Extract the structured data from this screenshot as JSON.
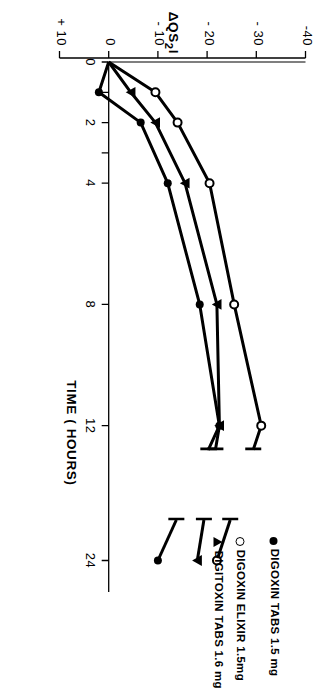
{
  "chart_data": {
    "type": "line",
    "title": "",
    "subtitle": "",
    "xlabel": "TIME ( HOURS)",
    "ylabel": "ΔQS₂I",
    "xlim": [
      0,
      26
    ],
    "ylim": [
      -40,
      10
    ],
    "xticks": [
      0,
      1,
      2,
      3,
      4,
      8,
      12,
      24
    ],
    "xtick_labels": [
      "0",
      "",
      "2",
      "",
      "4",
      "8",
      "12",
      "24"
    ],
    "yticks": [
      -40,
      -30,
      -20,
      -10,
      0,
      10
    ],
    "ytick_labels": [
      "-40",
      "- 30",
      "- 20",
      "- 10",
      "0",
      "+ 10"
    ],
    "grid": false,
    "legend_position": "upper-right-inside",
    "zero_reference_line": true,
    "axis_break": {
      "present": true,
      "between": [
        13.0,
        20.0
      ]
    },
    "series": [
      {
        "name": "DIGITOXIN TABS 1.6 mg",
        "marker": "filled-triangle",
        "color": "#000000",
        "x": [
          0,
          1,
          2,
          4,
          8,
          12,
          24
        ],
        "y": [
          0,
          -4.5,
          -9.5,
          -15.5,
          -22.0,
          -22.5,
          -18.0
        ]
      },
      {
        "name": "DIGOXIN ELIXIR 1.5mg",
        "marker": "open-circle",
        "color": "#000000",
        "x": [
          0,
          1,
          2,
          4,
          8,
          12,
          24
        ],
        "y": [
          0,
          -9.5,
          -14.0,
          -20.5,
          -25.5,
          -31.0,
          -22.0
        ]
      },
      {
        "name": "DIGOXIN TABS 1.5 mg",
        "marker": "filled-circle",
        "color": "#000000",
        "x": [
          0,
          1,
          2,
          4,
          8,
          12,
          24
        ],
        "y": [
          0,
          2.0,
          -6.5,
          -12.0,
          -18.5,
          -22.5,
          -10.0
        ]
      }
    ]
  },
  "legend": {
    "items": [
      {
        "label": "DIGITOXIN TABS  1.6 mg",
        "marker": "filled-triangle"
      },
      {
        "label": "DIGOXIN ELIXIR 1.5mg",
        "marker": "open-circle"
      },
      {
        "label": "DIGOXIN TABS  1.5 mg",
        "marker": "filled-circle"
      }
    ]
  },
  "axes": {
    "x": {
      "title": "TIME ( HOURS)",
      "tick_labels": [
        "0",
        "2",
        "4",
        "8",
        "12",
        "24"
      ]
    },
    "y": {
      "title_main": "ΔQS",
      "title_sub": "2",
      "title_tail": "I",
      "tick_labels": [
        "-40",
        "- 30",
        "- 20",
        "- 10",
        "0",
        "+ 10"
      ]
    }
  }
}
